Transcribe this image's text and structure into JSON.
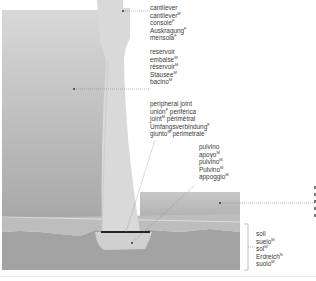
{
  "colors": {
    "reservoir_top": "#d6d6d6",
    "reservoir_bottom": "#a9a9a9",
    "dam": "#d9d9d9",
    "soil": "#a4a4a4",
    "sediment": "#bdbdbd",
    "downstream_water": "#b5b5b5",
    "joint": "#222222",
    "leader": "#8a8a8a",
    "text": "#3a3a3a"
  },
  "labels": {
    "cantilever": [
      {
        "term": "cantilever",
        "gender": ""
      },
      {
        "term": "cantilever",
        "gender": "M"
      },
      {
        "term": "console",
        "gender": "F"
      },
      {
        "term": "Auskragung",
        "gender": "F"
      },
      {
        "term": "mensola",
        "gender": "F"
      }
    ],
    "reservoir": [
      {
        "term": "reservoir",
        "gender": ""
      },
      {
        "term": "embalse",
        "gender": "M"
      },
      {
        "term": "réservoir",
        "gender": "M"
      },
      {
        "term": "Stausee",
        "gender": "M"
      },
      {
        "term": "bacino",
        "gender": "M"
      }
    ],
    "peripheral_joint": [
      {
        "term": "peripheral joint",
        "gender": ""
      },
      {
        "term": "unión",
        "gender": "F",
        "suffix": " periférica"
      },
      {
        "term": "joint",
        "gender": "M",
        "suffix": " périmétral"
      },
      {
        "term": "Umfangsverbindung",
        "gender": "F"
      },
      {
        "term": "giunto",
        "gender": "M",
        "suffix": " perimetrale"
      }
    ],
    "pulvino": [
      {
        "term": "pulvino",
        "gender": ""
      },
      {
        "term": "apoyo",
        "gender": "M"
      },
      {
        "term": "pulvino",
        "gender": "M"
      },
      {
        "term": "Pulvino",
        "gender": "M"
      },
      {
        "term": "appoggio",
        "gender": "M"
      }
    ],
    "soil": [
      {
        "term": "soil",
        "gender": ""
      },
      {
        "term": "suelo",
        "gender": "M"
      },
      {
        "term": "sol",
        "gender": "M"
      },
      {
        "term": "Erdreich",
        "gender": "N"
      },
      {
        "term": "suolo",
        "gender": "M"
      }
    ]
  }
}
